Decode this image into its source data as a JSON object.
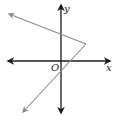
{
  "diagram": {
    "type": "coordinate-graph",
    "axes": {
      "x_label": "x",
      "y_label": "y",
      "origin_label": "O",
      "axis_color": "#1a1a1a"
    },
    "graph": {
      "shape": "V opening left (absolute-value type)",
      "line_color": "#8a8a8a",
      "vertex_px": [
        86,
        44
      ],
      "upper_ray_end_px": [
        8,
        13
      ],
      "lower_ray_end_px": [
        22,
        113
      ]
    }
  }
}
